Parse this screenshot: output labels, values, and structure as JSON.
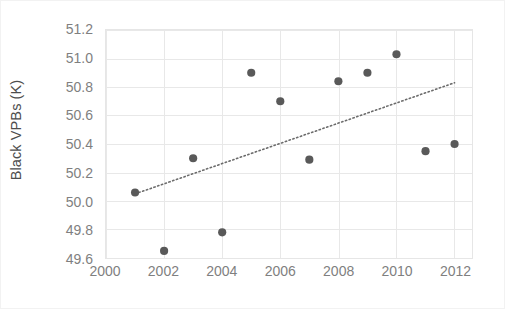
{
  "chart_data": {
    "type": "scatter",
    "title": "",
    "xlabel": "",
    "ylabel": "Black VPBs (K)",
    "xlim": [
      2000,
      2012.6
    ],
    "ylim": [
      49.6,
      51.2
    ],
    "grid": true,
    "legend": "none",
    "x_ticks": [
      "2000",
      "2002",
      "2004",
      "2006",
      "2008",
      "2010",
      "2012"
    ],
    "x_tick_values": [
      2000,
      2002,
      2004,
      2006,
      2008,
      2010,
      2012
    ],
    "y_ticks": [
      "49.6",
      "49.8",
      "50.0",
      "50.2",
      "50.4",
      "50.6",
      "50.8",
      "51.0",
      "51.2"
    ],
    "y_tick_values": [
      49.6,
      49.8,
      50.0,
      50.2,
      50.4,
      50.6,
      50.8,
      51.0,
      51.2
    ],
    "marker_color": "#595959",
    "gridline_color": "#e8e8e8",
    "tick_label_color": "#7f7f7f",
    "axis_title_color": "#4d4d4d",
    "series": [
      {
        "name": "Black VPBs (K)",
        "kind": "scatter",
        "x": [
          2001,
          2002,
          2003,
          2004,
          2005,
          2006,
          2007,
          2008,
          2009,
          2010,
          2011,
          2012
        ],
        "values": [
          50.06,
          49.65,
          50.3,
          49.78,
          50.9,
          50.7,
          50.29,
          50.84,
          50.9,
          51.03,
          50.35,
          50.4
        ]
      },
      {
        "name": "Linear trendline",
        "kind": "line",
        "style": "dotted",
        "x": [
          2001,
          2012
        ],
        "values": [
          50.05,
          50.83
        ]
      }
    ]
  }
}
